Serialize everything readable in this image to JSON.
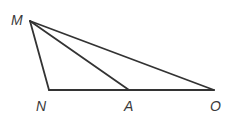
{
  "diagram": {
    "type": "triangle",
    "stroke_color": "#333333",
    "points": {
      "M": {
        "label": "M",
        "x": 30,
        "y": 21,
        "label_x": 11,
        "label_y": 25
      },
      "N": {
        "label": "N",
        "x": 49,
        "y": 90,
        "label_x": 36,
        "label_y": 111
      },
      "A": {
        "label": "A",
        "x": 129,
        "y": 90,
        "label_x": 124,
        "label_y": 111
      },
      "O": {
        "label": "O",
        "x": 214,
        "y": 90,
        "label_x": 210,
        "label_y": 111
      }
    },
    "segments": [
      {
        "from": "M",
        "to": "N"
      },
      {
        "from": "N",
        "to": "O"
      },
      {
        "from": "M",
        "to": "O"
      },
      {
        "from": "M",
        "to": "A"
      }
    ]
  }
}
